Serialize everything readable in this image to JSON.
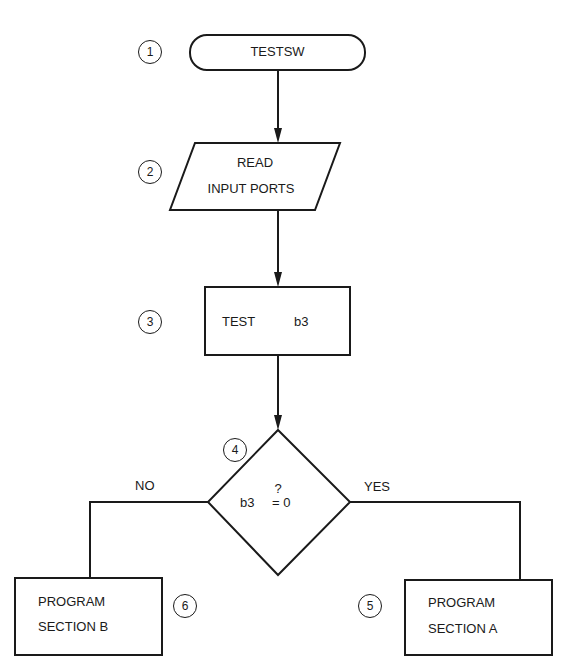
{
  "diagram": {
    "type": "flowchart",
    "nodes": [
      {
        "id": 1,
        "step": "1",
        "shape": "terminal",
        "label": "TESTSW"
      },
      {
        "id": 2,
        "step": "2",
        "shape": "parallelogram",
        "line1": "READ",
        "line2": "INPUT PORTS"
      },
      {
        "id": 3,
        "step": "3",
        "shape": "process",
        "label_a": "TEST",
        "label_b": "b3"
      },
      {
        "id": 4,
        "step": "4",
        "shape": "decision",
        "q": "?",
        "left": "b3",
        "right": "= 0"
      },
      {
        "id": 5,
        "step": "5",
        "shape": "process",
        "line1": "PROGRAM",
        "line2": "SECTION A"
      },
      {
        "id": 6,
        "step": "6",
        "shape": "process",
        "line1": "PROGRAM",
        "line2": "SECTION B"
      }
    ],
    "branches": {
      "no": "NO",
      "yes": "YES"
    },
    "edges": [
      {
        "from": 1,
        "to": 2
      },
      {
        "from": 2,
        "to": 3
      },
      {
        "from": 3,
        "to": 4
      },
      {
        "from": 4,
        "to": 6,
        "label": "NO"
      },
      {
        "from": 4,
        "to": 5,
        "label": "YES"
      }
    ],
    "stroke_color": "#1a1a1a"
  }
}
